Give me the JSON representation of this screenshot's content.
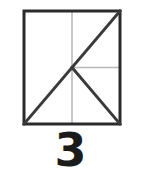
{
  "figure": {
    "caption": "3",
    "shape_name": "square",
    "colors": {
      "border": "#2b2b2b",
      "diagonal": "#3a3a3a",
      "guide": "#b9b9b9",
      "caption": "#1b1b1b",
      "background": "#ffffff"
    },
    "square": {
      "x": 24,
      "y": 11,
      "width": 96,
      "height": 113,
      "stroke_width": 3
    },
    "center": {
      "x": 72,
      "y": 67.5
    },
    "lines": [
      {
        "name": "diagonal-top-right-to-bottom-left",
        "style": "solid-dark",
        "x1": 120,
        "y1": 11,
        "x2": 24,
        "y2": 124,
        "stroke_width": 3
      },
      {
        "name": "diagonal-center-to-bottom-right",
        "style": "solid-dark",
        "x1": 72,
        "y1": 67.5,
        "x2": 120,
        "y2": 124,
        "stroke_width": 3
      },
      {
        "name": "guide-vertical-midline",
        "style": "light-gray",
        "x1": 72,
        "y1": 11,
        "x2": 72,
        "y2": 124,
        "stroke_width": 1.6
      },
      {
        "name": "guide-horizontal-center-to-right",
        "style": "light-gray",
        "x1": 72,
        "y1": 67.5,
        "x2": 120,
        "y2": 67.5,
        "stroke_width": 1.6
      }
    ]
  }
}
